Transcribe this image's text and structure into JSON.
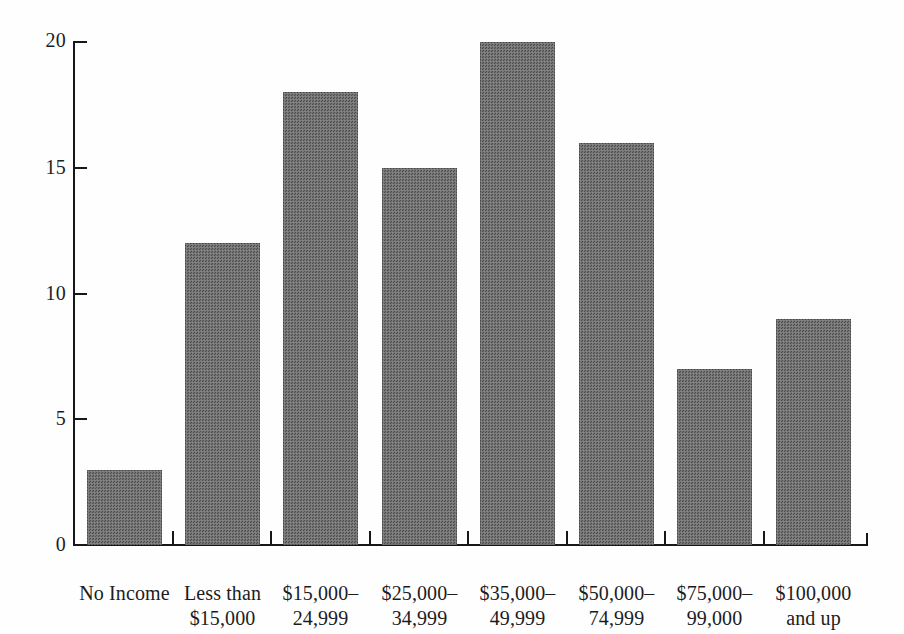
{
  "chart_data": {
    "type": "bar",
    "title": "",
    "subtitle": "",
    "xlabel": "",
    "ylabel": "",
    "categories": [
      "No Income",
      "Less than\n$15,000",
      "$15,000–\n24,999",
      "$25,000–\n34,999",
      "$35,000–\n49,999",
      "$50,000–\n74,999",
      "$75,000–\n99,000",
      "$100,000\nand up"
    ],
    "category_lines": [
      {
        "line1": "No Income",
        "line2": ""
      },
      {
        "line1": "Less than",
        "line2": "$15,000"
      },
      {
        "line1": "$15,000–",
        "line2": "24,999"
      },
      {
        "line1": "$25,000–",
        "line2": "34,999"
      },
      {
        "line1": "$35,000–",
        "line2": "49,999"
      },
      {
        "line1": "$50,000–",
        "line2": "74,999"
      },
      {
        "line1": "$75,000–",
        "line2": "99,000"
      },
      {
        "line1": "$100,000",
        "line2": "and up"
      }
    ],
    "values": [
      3,
      12,
      18,
      15,
      20,
      16,
      7,
      9
    ],
    "ylim": [
      0,
      20
    ],
    "yticks": [
      0,
      5,
      10,
      15,
      20
    ],
    "ytick_labels": [
      "0",
      "5",
      "10",
      "15",
      "20"
    ],
    "grid": false,
    "legend": false,
    "legend_position": "none",
    "bar_color": "#717171",
    "axis_color": "#17171a",
    "background_color": "#fefefe",
    "note": "Top y tick label '20' is clipped by the top edge of the page image."
  }
}
